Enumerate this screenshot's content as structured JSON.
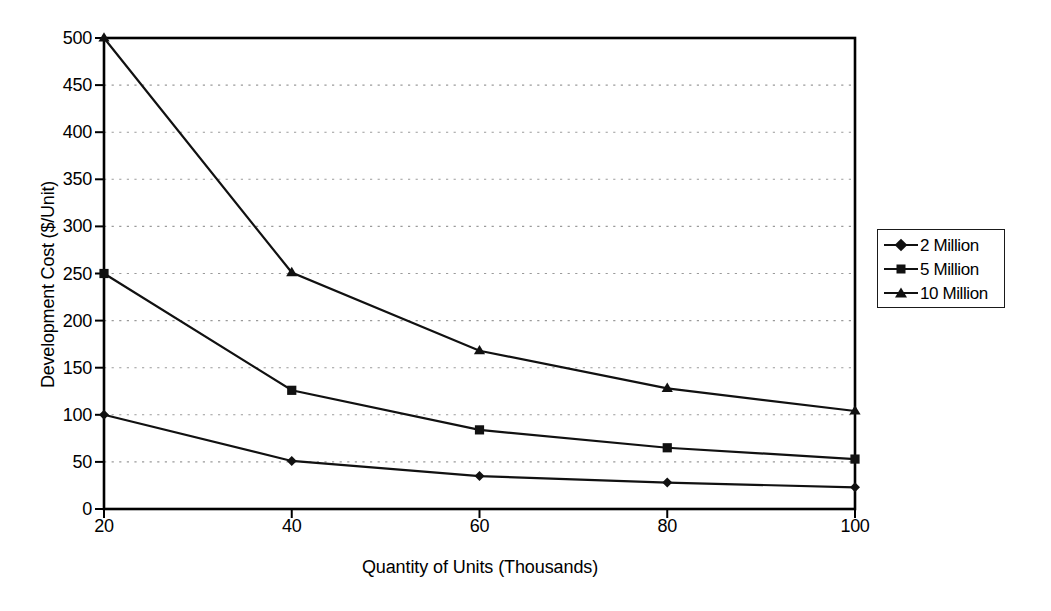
{
  "chart_data": {
    "type": "line",
    "title": "",
    "xlabel": "Quantity of Units (Thousands)",
    "ylabel": "Development Cost ($/Unit)",
    "x": [
      20,
      40,
      60,
      80,
      100
    ],
    "xticklabels": [
      "20",
      "40",
      "60",
      "80",
      "100"
    ],
    "yticks": [
      0,
      50,
      100,
      150,
      200,
      250,
      300,
      350,
      400,
      450,
      500
    ],
    "yticklabels": [
      "0",
      "50",
      "100",
      "150",
      "200",
      "250",
      "300",
      "350",
      "400",
      "450",
      "500"
    ],
    "xlim": [
      20,
      100
    ],
    "ylim": [
      0,
      500
    ],
    "grid": "horizontal-dotted",
    "legend_position": "right",
    "series": [
      {
        "name": "2 Million",
        "marker": "diamond",
        "color": "#111111",
        "values": [
          100,
          51,
          35,
          28,
          23
        ]
      },
      {
        "name": "5 Million",
        "marker": "square",
        "color": "#111111",
        "values": [
          250,
          126,
          84,
          65,
          53
        ]
      },
      {
        "name": "10 Million",
        "marker": "triangle",
        "color": "#111111",
        "values": [
          500,
          251,
          168,
          128,
          104
        ]
      }
    ]
  },
  "axes": {
    "y_title": "Development Cost ($/Unit)",
    "x_title": "Quantity of Units (Thousands)"
  },
  "legend": {
    "items": [
      {
        "label": "2 Million",
        "marker": "diamond"
      },
      {
        "label": "5 Million",
        "marker": "square"
      },
      {
        "label": "10 Million",
        "marker": "triangle"
      }
    ]
  },
  "colors": {
    "line": "#111111",
    "axis": "#000000",
    "grid": "#9a9a9a",
    "background": "#ffffff"
  }
}
